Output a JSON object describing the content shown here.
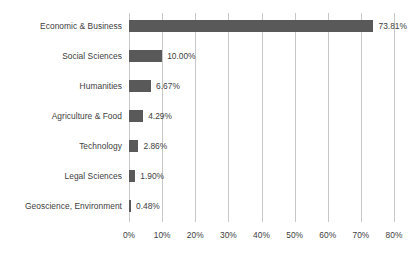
{
  "chart_data": {
    "type": "bar",
    "orientation": "horizontal",
    "title": "",
    "xlabel": "",
    "ylabel": "",
    "xlim": [
      0,
      80
    ],
    "grid": true,
    "legend": "none",
    "tick_labels": [
      "0%",
      "10%",
      "20%",
      "30%",
      "40%",
      "50%",
      "60%",
      "70%",
      "80%"
    ],
    "tick_values": [
      0,
      10,
      20,
      30,
      40,
      50,
      60,
      70,
      80
    ],
    "categories": [
      "Economic & Business",
      "Social Sciences",
      "Humanities",
      "Agriculture & Food",
      "Technology",
      "Legal Sciences",
      "Geoscience, Environment"
    ],
    "values": [
      73.81,
      10.0,
      6.67,
      4.29,
      2.86,
      1.9,
      0.48
    ],
    "data_labels": [
      "73.81%",
      "10.00%",
      "6.67%",
      "4.29%",
      "2.86%",
      "1.90%",
      "0.48%"
    ],
    "bars": [
      {
        "category": "Economic & Business",
        "value": 73.81,
        "label": "73.81%"
      },
      {
        "category": "Social Sciences",
        "value": 10.0,
        "label": "10.00%"
      },
      {
        "category": "Humanities",
        "value": 6.67,
        "label": "6.67%"
      },
      {
        "category": "Agriculture & Food",
        "value": 4.29,
        "label": "4.29%"
      },
      {
        "category": "Technology",
        "value": 2.86,
        "label": "2.86%"
      },
      {
        "category": "Legal Sciences",
        "value": 1.9,
        "label": "1.90%"
      },
      {
        "category": "Geoscience, Environment",
        "value": 0.48,
        "label": "0.48%"
      }
    ],
    "colors": {
      "bar": "#595959",
      "gridline": "#c8c8c8",
      "text": "#404040",
      "background": "#ffffff"
    }
  }
}
